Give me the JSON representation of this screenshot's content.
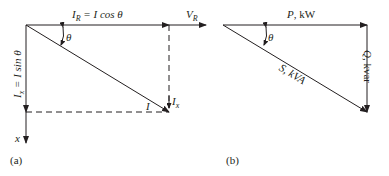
{
  "diagram_a": {
    "panel_label": "(a)",
    "ir_label": "I",
    "ir_sub": "R",
    "ir_eq": " = I cos θ",
    "vr_label": "V",
    "vr_sub": "R",
    "theta": "θ",
    "ix_side_label": "I",
    "ix_side_sub": "x",
    "ix_side_eq": " = I sin θ",
    "i_label": "I",
    "ix_label": "I",
    "ix_sub": "x",
    "x_axis_label": "x"
  },
  "diagram_b": {
    "panel_label": "(b)",
    "p_label": "P, kW",
    "q_label": "Q, kvar",
    "s_label": "S, kVA",
    "theta": "θ"
  },
  "colors": {
    "line": "#231f20",
    "background": "#ffffff"
  }
}
